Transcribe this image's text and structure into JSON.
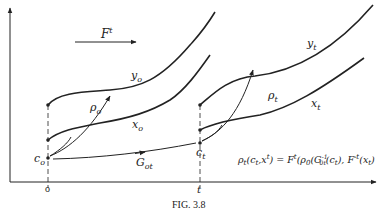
{
  "figure": {
    "caption": "FIG. 3.8",
    "flow_label": "F",
    "flow_sup": "t",
    "time_origin": "o",
    "time_t": "t",
    "curves": {
      "y0": {
        "base": "y",
        "sub": "o"
      },
      "x0": {
        "base": "x",
        "sub": "o"
      },
      "yt": {
        "base": "y",
        "sub": "t"
      },
      "xt": {
        "base": "x",
        "sub": "t"
      }
    },
    "points": {
      "c0": {
        "base": "c",
        "sub": "o"
      },
      "ct": {
        "base": "c",
        "sub": "t"
      }
    },
    "maps": {
      "rho0": {
        "base": "ρ",
        "sub": "o"
      },
      "rhot": {
        "base": "ρ",
        "sub": "t"
      },
      "G0t": {
        "base": "G",
        "sub": "ot"
      }
    },
    "formula": "ρt(ct,x^t) = F^t(ρ0(G0t^-1(ct), F^-t(xt))",
    "formula_parts": {
      "lhs_rho": "ρ",
      "lhs_rho_sub": "t",
      "lhs_args_open": "(c",
      "lhs_c_sub": "t",
      "lhs_comma_x": ",x",
      "lhs_x_sup": "t",
      "lhs_close": ") = ",
      "F": "F",
      "F_sup": "t",
      "open_rho": "(ρ",
      "rho_sub": "0",
      "G_open": "(G",
      "G_sub": "0t",
      "G_sup": "-1",
      "c_open": "(c",
      "c_sub": "t",
      "c_close": "), ",
      "F2": "F",
      "F2_sup": "-t",
      "x_open": "(x",
      "x_sub": "t",
      "x_close": ")"
    }
  }
}
